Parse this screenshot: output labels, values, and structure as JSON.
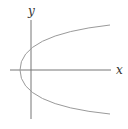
{
  "diagram": {
    "type": "coordinate-graph",
    "axes": {
      "x_label": "x",
      "y_label": "y"
    },
    "curve": {
      "shape": "parabola",
      "orientation": "opens-right",
      "equation_form": "x = y^2 - c",
      "vertex_position": "negative x-axis"
    },
    "colors": {
      "axis": "#777777",
      "curve": "#9a9a9a",
      "label": "#333333",
      "background": "#ffffff"
    }
  }
}
